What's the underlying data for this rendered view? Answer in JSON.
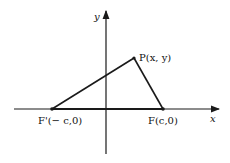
{
  "diagram": {
    "axes": {
      "x_label": "x",
      "y_label": "y"
    },
    "points": {
      "P": {
        "label": "P(x, y)"
      },
      "F_prime": {
        "label": "F'(− c,0)"
      },
      "F": {
        "label": "F(c,0)"
      }
    },
    "colors": {
      "line": "#1a1a1a",
      "background": "#ffffff"
    }
  }
}
